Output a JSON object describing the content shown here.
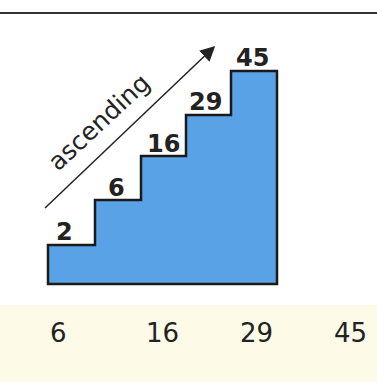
{
  "diagram": {
    "label": "ascending",
    "steps": [
      {
        "value": "2"
      },
      {
        "value": "6"
      },
      {
        "value": "16"
      },
      {
        "value": "29"
      },
      {
        "value": "45"
      }
    ],
    "colors": {
      "fill": "#5aa2e6",
      "stroke": "#1a1a1a",
      "band": "#fdfbe8"
    }
  },
  "sequence": [
    "6",
    "16",
    "29",
    "45"
  ]
}
